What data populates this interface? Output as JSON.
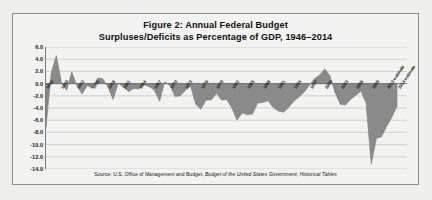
{
  "figure": {
    "title_line1": "Figure 2: Annual Federal Budget",
    "title_line2": "Surpluses/Deficits as Percentage of GDP, 1946–2014",
    "source_prefix": "Source: U.S. Office of Management and Budget, ",
    "source_italic": "Budget of the United States Government, Historical Tables"
  },
  "colors": {
    "page_background": "#eeeeec",
    "panel_background": "#f2f2f0",
    "panel_border": "#8d8d8d",
    "area_fill": "#8a8a8a",
    "area_stroke": "#6f6f6f",
    "gridline": "#c2c2c2",
    "axis_line": "#7d7d7d",
    "text": "#1a1a1a"
  },
  "chart_data": {
    "type": "area",
    "title": "Figure 2: Annual Federal Budget Surpluses/Deficits as Percentage of GDP, 1946–2014",
    "xlabel": "",
    "ylabel": "",
    "ylim": [
      -14.0,
      6.0
    ],
    "yticks": [
      6.0,
      4.0,
      2.0,
      0.0,
      -2.0,
      -4.0,
      -6.0,
      -8.0,
      -10.0,
      -12.0,
      -14.0
    ],
    "ytick_labels": [
      "6.0",
      "4.0",
      "2.0",
      "0.0",
      "-2.0",
      "-4.0",
      "-6.0",
      "-8.0",
      "-10.0",
      "-12.0",
      "-14.0"
    ],
    "grid": true,
    "legend": false,
    "baseline": 0.0,
    "xtick_step": 3,
    "x": [
      1946,
      1947,
      1948,
      1949,
      1950,
      1951,
      1952,
      1953,
      1954,
      1955,
      1956,
      1957,
      1958,
      1959,
      1960,
      1961,
      1962,
      1963,
      1964,
      1965,
      1966,
      1967,
      1968,
      1969,
      1970,
      1971,
      1972,
      1973,
      1974,
      1975,
      1976,
      1977,
      1978,
      1979,
      1980,
      1981,
      1982,
      1983,
      1984,
      1985,
      1986,
      1987,
      1988,
      1989,
      1990,
      1991,
      1992,
      1993,
      1994,
      1995,
      1996,
      1997,
      1998,
      1999,
      2000,
      2001,
      2002,
      2003,
      2004,
      2005,
      2006,
      2007,
      2008,
      2009,
      2010,
      2011,
      2012,
      2013,
      2014
    ],
    "xtick_labels": [
      "1946",
      "1949",
      "1952",
      "1955",
      "1958",
      "1961",
      "1964",
      "1967",
      "1970",
      "1973",
      "1976",
      "1979",
      "1982",
      "1985",
      "1988",
      "1991",
      "1994",
      "1997",
      "2000",
      "2003",
      "2006",
      "2009",
      "2012 estimate",
      "2014 estimate"
    ],
    "xtick_years": [
      1946,
      1949,
      1952,
      1955,
      1958,
      1961,
      1964,
      1967,
      1970,
      1973,
      1976,
      1979,
      1982,
      1985,
      1988,
      1991,
      1994,
      1997,
      2000,
      2003,
      2006,
      2009,
      2012,
      2014
    ],
    "values": [
      -7.2,
      1.7,
      4.6,
      0.2,
      -1.1,
      1.9,
      -0.4,
      -1.7,
      -0.3,
      -0.8,
      0.9,
      0.8,
      -0.6,
      -2.6,
      0.1,
      -0.6,
      -1.3,
      -0.8,
      -0.9,
      -0.2,
      -0.5,
      -1.1,
      -2.9,
      0.3,
      -0.3,
      -2.1,
      -2.0,
      -1.1,
      -0.4,
      -3.4,
      -4.2,
      -2.7,
      -2.7,
      -1.6,
      -2.7,
      -2.6,
      -4.0,
      -6.0,
      -4.8,
      -5.1,
      -5.0,
      -3.2,
      -3.1,
      -2.8,
      -3.9,
      -4.5,
      -4.7,
      -3.9,
      -2.9,
      -2.2,
      -1.4,
      -0.3,
      0.8,
      1.4,
      2.4,
      1.3,
      -1.5,
      -3.4,
      -3.5,
      -2.6,
      -1.9,
      -1.2,
      -3.2,
      -13.2,
      -9.0,
      -8.7,
      -7.0,
      -5.5,
      -3.7
    ],
    "series_name": "Surplus/Deficit as % of GDP",
    "annotations": [
      {
        "year": 1946,
        "value": -7.2,
        "note": "postwar deficit trough"
      },
      {
        "year": 1948,
        "value": 4.6,
        "note": "largest surplus in series"
      },
      {
        "year": 2000,
        "value": 2.4,
        "note": "late-1990s surplus peak"
      },
      {
        "year": 2009,
        "value": -13.2,
        "note": "deepest deficit in series"
      }
    ]
  }
}
